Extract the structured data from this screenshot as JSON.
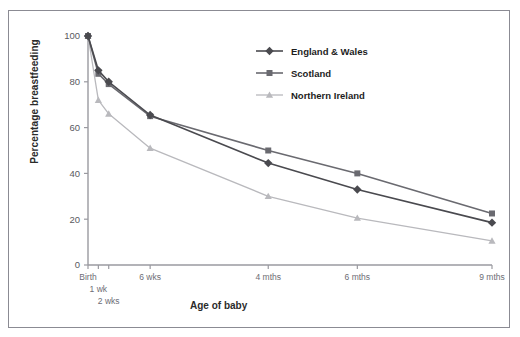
{
  "chart_data": {
    "type": "line",
    "title": "",
    "xlabel": "Age of baby",
    "ylabel": "Percentage breastfeeding",
    "categories": [
      "Birth",
      "1 wk",
      "2 wks",
      "6 wks",
      "4 mths",
      "6 mths",
      "9 mths"
    ],
    "x_positions": [
      0,
      1,
      2,
      6,
      17.4,
      26,
      39
    ],
    "xlim": [
      0,
      39
    ],
    "ylim": [
      0,
      100
    ],
    "yticks": [
      0,
      20,
      40,
      60,
      80,
      100
    ],
    "grid": false,
    "legend_position": "top-right",
    "series": [
      {
        "name": "England & Wales",
        "marker": "diamond",
        "color": "#4a4a4f",
        "values": [
          100,
          85,
          80,
          65.5,
          44.5,
          33,
          18.5
        ]
      },
      {
        "name": "Scotland",
        "marker": "square",
        "color": "#6a6a70",
        "values": [
          100,
          83.5,
          79,
          65,
          50,
          40,
          22.5
        ]
      },
      {
        "name": "Northern Ireland",
        "marker": "triangle",
        "color": "#b9b9bd",
        "values": [
          100,
          72,
          66,
          51,
          30,
          20.5,
          10.5
        ]
      }
    ]
  },
  "axis": {
    "y_tick_labels": [
      "0",
      "20",
      "40",
      "60",
      "80",
      "100"
    ],
    "x_tick_labels": [
      "Birth",
      "1 wk",
      "2 wks",
      "6 wks",
      "4 mths",
      "6 mths",
      "9 mths"
    ],
    "x_label": "Age of baby",
    "y_label": "Percentage breastfeeding"
  },
  "legend": {
    "items": [
      {
        "label": "England & Wales"
      },
      {
        "label": "Scotland"
      },
      {
        "label": "Northern Ireland"
      }
    ]
  },
  "colors": {
    "england_wales": "#4a4a4f",
    "scotland": "#6a6a70",
    "northern_ireland": "#b9b9bd",
    "axis": "#9a9aa0",
    "frame": "#8b8b93",
    "text": "#2b2b2b"
  },
  "bleed_text": " "
}
